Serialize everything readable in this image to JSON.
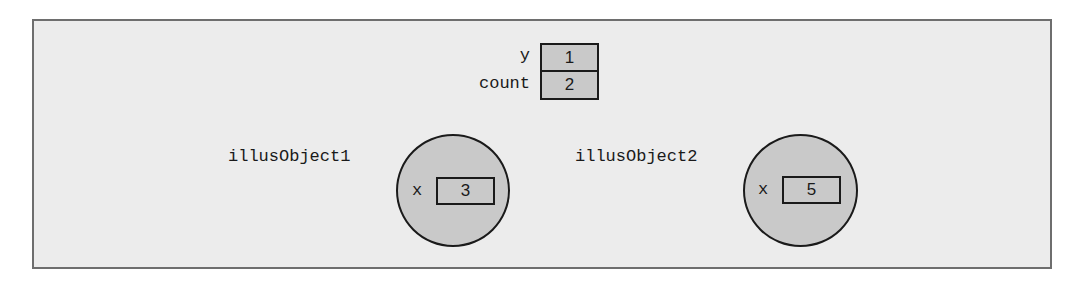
{
  "diagram": {
    "variables": [
      {
        "name": "y",
        "value": "1"
      },
      {
        "name": "count",
        "value": "2"
      }
    ],
    "objects": [
      {
        "name": "illusObject1",
        "field": "x",
        "value": "3"
      },
      {
        "name": "illusObject2",
        "field": "x",
        "value": "5"
      }
    ],
    "colors": {
      "background": "#ececec",
      "fill": "#c9c9c9",
      "stroke": "#1a1a1a",
      "frame_border": "#6e6e6e"
    }
  }
}
